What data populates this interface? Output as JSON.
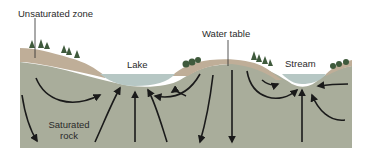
{
  "diagram": {
    "type": "groundwater-flow-cross-section",
    "labels": {
      "unsaturated_zone": "Unsaturated zone",
      "water_table": "Water table",
      "lake": "Lake",
      "stream": "Stream",
      "saturated_rock_line1": "Saturated",
      "saturated_rock_line2": "rock"
    },
    "colors": {
      "background": "#ffffff",
      "unsaturated_zone": "#bfae98",
      "saturated_rock": "#a9ad9b",
      "water": "#b6c7c4",
      "trees": "#3f5a3c",
      "arrows": "#1a1a1a",
      "text": "#2a2a2a"
    },
    "features": [
      {
        "name": "Lake",
        "role": "discharge-area"
      },
      {
        "name": "Stream",
        "role": "discharge-area"
      },
      {
        "name": "Central hill",
        "role": "recharge-area"
      },
      {
        "name": "Left hill",
        "role": "recharge-area"
      }
    ]
  }
}
